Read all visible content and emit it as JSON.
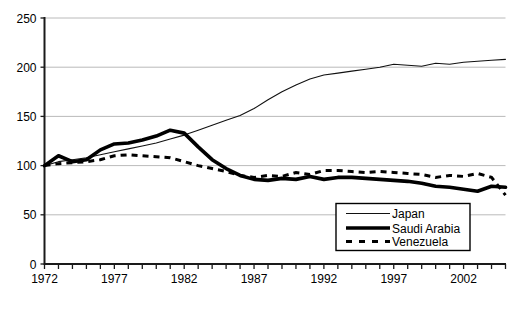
{
  "chart_data": {
    "type": "line",
    "title": "",
    "subtitle": "",
    "xlabel": "",
    "ylabel": "",
    "xlim": [
      1972,
      2005
    ],
    "ylim": [
      0,
      250
    ],
    "grid": true,
    "legend_position": "bottom-right",
    "ytick_labels": [
      "0",
      "50",
      "100",
      "150",
      "200",
      "250"
    ],
    "ytick_values": [
      0,
      50,
      100,
      150,
      200,
      250
    ],
    "xtick_labels": [
      "1972",
      "1977",
      "1982",
      "1987",
      "1992",
      "1997",
      "2002"
    ],
    "xtick_values": [
      1972,
      1977,
      1982,
      1987,
      1992,
      1997,
      2002
    ],
    "x": [
      1972,
      1973,
      1974,
      1975,
      1976,
      1977,
      1978,
      1979,
      1980,
      1981,
      1982,
      1983,
      1984,
      1985,
      1986,
      1987,
      1988,
      1989,
      1990,
      1991,
      1992,
      1993,
      1994,
      1995,
      1996,
      1997,
      1998,
      1999,
      2000,
      2001,
      2002,
      2003,
      2004,
      2005
    ],
    "series": [
      {
        "name": "Japan",
        "style": "thin-solid",
        "color": "#111111",
        "values": [
          100,
          104,
          106,
          108,
          111,
          114,
          117,
          120,
          123,
          127,
          131,
          136,
          141,
          146,
          151,
          158,
          167,
          175,
          182,
          188,
          192,
          194,
          196,
          198,
          200,
          203,
          202,
          201,
          204,
          203,
          205,
          206,
          207,
          208
        ]
      },
      {
        "name": "Saudi Arabia",
        "style": "thick-solid",
        "color": "#000000",
        "values": [
          100,
          110,
          104,
          106,
          116,
          122,
          123,
          126,
          130,
          136,
          133,
          119,
          106,
          97,
          90,
          86,
          85,
          87,
          86,
          89,
          86,
          88,
          88,
          87,
          86,
          85,
          84,
          82,
          79,
          78,
          76,
          74,
          79,
          78
        ]
      },
      {
        "name": "Venezuela",
        "style": "dashed",
        "color": "#000000",
        "values": [
          100,
          102,
          103,
          104,
          106,
          110,
          111,
          110,
          109,
          108,
          104,
          100,
          97,
          94,
          90,
          88,
          90,
          89,
          93,
          91,
          95,
          95,
          94,
          93,
          94,
          93,
          92,
          91,
          88,
          90,
          89,
          92,
          88,
          70
        ]
      }
    ],
    "legend_entries": [
      {
        "label": "Japan",
        "style": "thin-solid"
      },
      {
        "label": "Saudi Arabia",
        "style": "thick-solid"
      },
      {
        "label": "Venezuela",
        "style": "dashed"
      }
    ]
  }
}
